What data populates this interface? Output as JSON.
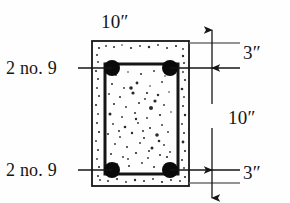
{
  "figure": {
    "type": "reinforced-concrete-beam-cross-section",
    "labels": {
      "top_width": "10″",
      "bars_top": "2 no. 9",
      "bars_bottom": "2 no. 9",
      "cover_top": "3″",
      "depth_middle": "10″",
      "cover_bottom": "3″"
    },
    "colors": {
      "line": "#151515",
      "rebar": "#0a0a0a",
      "background": "#fefefe",
      "speckle": "#2a2a2a"
    },
    "geometry": {
      "section": {
        "x": 92,
        "y": 41,
        "width": 97,
        "height": 145
      },
      "stirrup": {
        "x": 105,
        "y": 64,
        "width": 73,
        "height": 110
      },
      "rebars": [
        {
          "cx": 112,
          "cy": 68,
          "r": 8
        },
        {
          "cx": 170,
          "cy": 68,
          "r": 8
        },
        {
          "cx": 112,
          "cy": 170,
          "r": 8
        },
        {
          "cx": 170,
          "cy": 170,
          "r": 8
        }
      ],
      "dimension_line_x": 212,
      "extension_ys": [
        30,
        43,
        68,
        170,
        183,
        196
      ]
    },
    "speckles": [
      [
        99,
        48,
        1.1
      ],
      [
        106,
        46,
        0.9
      ],
      [
        114,
        47,
        1.0
      ],
      [
        122,
        45,
        0.8
      ],
      [
        131,
        48,
        1.1
      ],
      [
        140,
        46,
        0.9
      ],
      [
        149,
        47,
        1.2
      ],
      [
        158,
        45,
        0.9
      ],
      [
        167,
        48,
        1.0
      ],
      [
        176,
        46,
        1.1
      ],
      [
        183,
        49,
        0.9
      ],
      [
        97,
        55,
        1.0
      ],
      [
        183,
        56,
        1.2
      ],
      [
        98,
        62,
        0.9
      ],
      [
        184,
        63,
        1.0
      ],
      [
        96,
        71,
        1.1
      ],
      [
        183,
        72,
        0.9
      ],
      [
        98,
        79,
        1.0
      ],
      [
        185,
        80,
        1.1
      ],
      [
        97,
        88,
        0.9
      ],
      [
        182,
        89,
        1.3
      ],
      [
        99,
        96,
        1.0
      ],
      [
        184,
        97,
        0.9
      ],
      [
        96,
        105,
        1.1
      ],
      [
        183,
        106,
        1.0
      ],
      [
        98,
        114,
        0.9
      ],
      [
        185,
        115,
        1.2
      ],
      [
        97,
        123,
        1.0
      ],
      [
        182,
        124,
        0.9
      ],
      [
        99,
        132,
        1.1
      ],
      [
        184,
        133,
        1.0
      ],
      [
        96,
        141,
        0.9
      ],
      [
        183,
        142,
        1.4
      ],
      [
        98,
        150,
        1.0
      ],
      [
        185,
        151,
        1.1
      ],
      [
        97,
        159,
        0.9
      ],
      [
        182,
        160,
        1.0
      ],
      [
        99,
        167,
        1.1
      ],
      [
        184,
        168,
        0.9
      ],
      [
        98,
        176,
        1.0
      ],
      [
        185,
        177,
        1.1
      ],
      [
        100,
        180,
        0.9
      ],
      [
        108,
        181,
        1.0
      ],
      [
        117,
        179,
        1.1
      ],
      [
        126,
        182,
        0.9
      ],
      [
        135,
        180,
        1.2
      ],
      [
        144,
        181,
        1.0
      ],
      [
        153,
        179,
        0.9
      ],
      [
        162,
        182,
        1.1
      ],
      [
        171,
        180,
        1.0
      ],
      [
        180,
        181,
        0.9
      ],
      [
        116,
        75,
        0.9
      ],
      [
        128,
        72,
        0.8
      ],
      [
        141,
        74,
        1.0
      ],
      [
        154,
        71,
        0.9
      ],
      [
        165,
        76,
        0.8
      ],
      [
        112,
        84,
        1.0
      ],
      [
        124,
        88,
        0.9
      ],
      [
        137,
        83,
        1.4
      ],
      [
        150,
        86,
        0.8
      ],
      [
        162,
        82,
        0.9
      ],
      [
        109,
        94,
        0.9
      ],
      [
        120,
        97,
        1.0
      ],
      [
        133,
        93,
        1.6
      ],
      [
        145,
        99,
        0.9
      ],
      [
        158,
        95,
        1.2
      ],
      [
        169,
        92,
        0.8
      ],
      [
        114,
        104,
        1.0
      ],
      [
        126,
        107,
        0.9
      ],
      [
        139,
        103,
        1.0
      ],
      [
        151,
        108,
        2.0
      ],
      [
        164,
        105,
        0.9
      ],
      [
        110,
        114,
        1.5
      ],
      [
        122,
        117,
        0.9
      ],
      [
        135,
        113,
        1.0
      ],
      [
        147,
        118,
        0.9
      ],
      [
        160,
        115,
        1.1
      ],
      [
        171,
        112,
        0.8
      ],
      [
        113,
        124,
        0.9
      ],
      [
        125,
        127,
        1.3
      ],
      [
        138,
        123,
        0.9
      ],
      [
        150,
        128,
        1.0
      ],
      [
        162,
        125,
        0.9
      ],
      [
        108,
        134,
        1.0
      ],
      [
        120,
        137,
        0.9
      ],
      [
        132,
        133,
        1.2
      ],
      [
        144,
        138,
        1.0
      ],
      [
        157,
        135,
        1.8
      ],
      [
        168,
        132,
        0.9
      ],
      [
        115,
        144,
        0.9
      ],
      [
        127,
        147,
        1.0
      ],
      [
        140,
        143,
        0.9
      ],
      [
        152,
        148,
        1.5
      ],
      [
        164,
        145,
        0.9
      ],
      [
        111,
        154,
        1.0
      ],
      [
        123,
        157,
        0.9
      ],
      [
        136,
        153,
        1.1
      ],
      [
        148,
        158,
        0.9
      ],
      [
        160,
        155,
        1.0
      ],
      [
        170,
        152,
        0.9
      ],
      [
        117,
        164,
        0.9
      ],
      [
        129,
        166,
        1.0
      ],
      [
        142,
        163,
        0.9
      ],
      [
        154,
        167,
        1.0
      ],
      [
        166,
        164,
        0.9
      ],
      [
        131,
        88,
        1.8
      ],
      [
        147,
        93,
        1.1
      ],
      [
        155,
        101,
        1.6
      ],
      [
        136,
        119,
        1.2
      ],
      [
        143,
        131,
        1.0
      ],
      [
        159,
        141,
        1.3
      ],
      [
        149,
        151,
        1.0
      ],
      [
        128,
        159,
        0.9
      ],
      [
        167,
        157,
        1.1
      ],
      [
        119,
        131,
        1.0
      ]
    ]
  }
}
